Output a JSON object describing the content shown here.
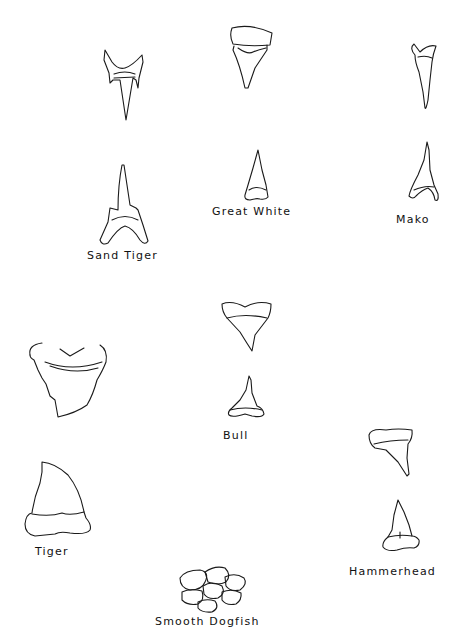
{
  "figure": {
    "background": "#ffffff",
    "line_color": "#1a1a1a",
    "species": [
      {
        "id": "sand-tiger",
        "label": "Sand Tiger"
      },
      {
        "id": "great-white",
        "label": "Great White"
      },
      {
        "id": "mako",
        "label": "Mako"
      },
      {
        "id": "tiger",
        "label": "Tiger"
      },
      {
        "id": "bull",
        "label": "Bull"
      },
      {
        "id": "hammerhead",
        "label": "Hammerhead"
      },
      {
        "id": "smooth-dogfish",
        "label": "Smooth Dogfish"
      }
    ]
  }
}
